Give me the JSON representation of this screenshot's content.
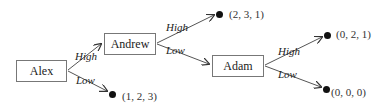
{
  "nodes": {
    "alex": {
      "label": "Alex"
    },
    "andrew": {
      "label": "Andrew"
    },
    "adam": {
      "label": "Adam"
    }
  },
  "edges": {
    "alex_high": {
      "label": "High"
    },
    "alex_low": {
      "label": "Low"
    },
    "andrew_high": {
      "label": "High"
    },
    "andrew_low": {
      "label": "Low"
    },
    "adam_high": {
      "label": "High"
    },
    "adam_low": {
      "label": "Low"
    }
  },
  "payoffs": {
    "andrew_high": "(2, 3, 1)",
    "alex_low": "(1, 2, 3)",
    "adam_high": "(0, 2, 1)",
    "adam_low": "(0, 0, 0)"
  },
  "colors": {
    "line": "#555555",
    "dot": "#111111",
    "border": "#777777"
  }
}
